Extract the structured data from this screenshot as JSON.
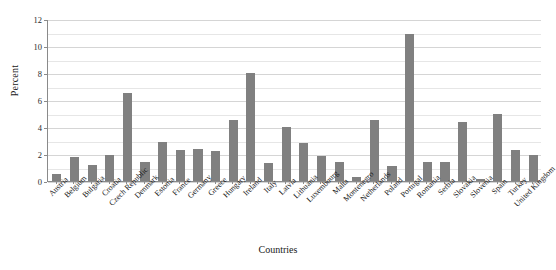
{
  "chart_data": {
    "type": "bar",
    "title": "",
    "xlabel": "Countries",
    "ylabel": "Percent",
    "ylim": [
      0,
      12
    ],
    "ytick_values": [
      0,
      2,
      4,
      6,
      8,
      10,
      12
    ],
    "ytick_labels": [
      "0",
      "2",
      "4",
      "6",
      "8",
      "10",
      "12"
    ],
    "minor_gridline_step": 1,
    "grid": true,
    "legend": "none",
    "bar_color": "#808080",
    "categories": [
      "Austria",
      "Belgium",
      "Bulgaria",
      "Croatia",
      "Czech Republic",
      "Denmark",
      "Estonia",
      "France",
      "Germany",
      "Greece",
      "Hungary",
      "Ireland",
      "Italy",
      "Latvia",
      "Lithuania",
      "Luxembourg",
      "Malta",
      "Montenegro",
      "Netherlands",
      "Poland",
      "Portugal",
      "Romania",
      "Serbia",
      "Slovakia",
      "Slovenia",
      "Spain",
      "Turkey",
      "United Kingdom"
    ],
    "values": [
      0.5,
      1.8,
      1.2,
      1.95,
      6.5,
      1.4,
      2.9,
      2.3,
      2.35,
      2.2,
      4.5,
      8.0,
      1.3,
      4.0,
      2.8,
      1.85,
      1.4,
      0.3,
      4.5,
      1.1,
      10.9,
      1.4,
      1.4,
      4.4,
      0.15,
      5.0,
      2.3,
      1.9
    ]
  }
}
